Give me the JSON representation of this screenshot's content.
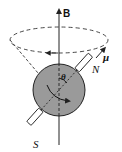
{
  "diagram": {
    "labels": {
      "field": "B",
      "moment": "μ",
      "north": "N",
      "south": "S",
      "angle": "θ"
    },
    "colors": {
      "sphere_fill": "#9a9a9a",
      "stroke": "#222222",
      "rod_fill": "#ffffff",
      "background": "#ffffff"
    }
  }
}
